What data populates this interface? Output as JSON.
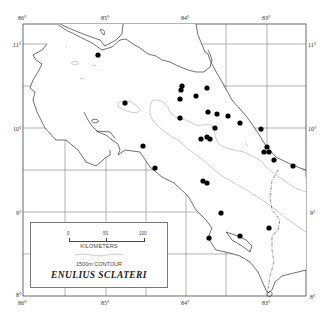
{
  "map": {
    "title": "ENULIUS SCLATERI",
    "longitude_labels": [
      {
        "label": "86°",
        "x": 23
      },
      {
        "label": "85°",
        "x": 106
      },
      {
        "label": "84°",
        "x": 186
      },
      {
        "label": "83°",
        "x": 267
      }
    ],
    "latitude_labels": [
      {
        "label": "11°",
        "y": 44
      },
      {
        "label": "10°",
        "y": 128
      },
      {
        "label": "9°",
        "y": 212
      },
      {
        "label": "8°",
        "y": 296
      }
    ],
    "colors": {
      "coastline": "#333333",
      "contour": "#bbbbbb",
      "grid": "#555555",
      "locality_dot": "#000000"
    }
  },
  "legend": {
    "scale_ticks": [
      "0",
      "50",
      "100"
    ],
    "scale_unit": "KILOMETERS",
    "contour_label": "1500m CONTOUR",
    "species_name": "ENULIUS SCLATERI"
  },
  "localities": [
    {
      "x": 98,
      "y": 55
    },
    {
      "x": 125,
      "y": 103
    },
    {
      "x": 143,
      "y": 146
    },
    {
      "x": 155,
      "y": 168
    },
    {
      "x": 182,
      "y": 86
    },
    {
      "x": 181,
      "y": 90
    },
    {
      "x": 180,
      "y": 99
    },
    {
      "x": 207,
      "y": 88
    },
    {
      "x": 196,
      "y": 96
    },
    {
      "x": 180,
      "y": 118
    },
    {
      "x": 208,
      "y": 112
    },
    {
      "x": 217,
      "y": 114
    },
    {
      "x": 215,
      "y": 128
    },
    {
      "x": 201,
      "y": 139
    },
    {
      "x": 207,
      "y": 137
    },
    {
      "x": 210,
      "y": 139
    },
    {
      "x": 228,
      "y": 116
    },
    {
      "x": 240,
      "y": 123
    },
    {
      "x": 261,
      "y": 129
    },
    {
      "x": 267,
      "y": 147
    },
    {
      "x": 264,
      "y": 152
    },
    {
      "x": 269,
      "y": 152
    },
    {
      "x": 274,
      "y": 160
    },
    {
      "x": 293,
      "y": 166
    },
    {
      "x": 203,
      "y": 181
    },
    {
      "x": 207,
      "y": 183
    },
    {
      "x": 221,
      "y": 213
    },
    {
      "x": 209,
      "y": 238
    },
    {
      "x": 240,
      "y": 236
    },
    {
      "x": 269,
      "y": 228
    }
  ]
}
